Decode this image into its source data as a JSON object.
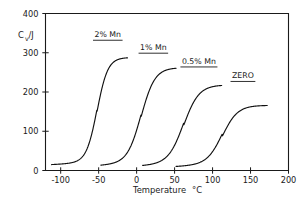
{
  "chart_data": {
    "type": "line",
    "title": "",
    "xlabel": "Temperature  °C",
    "ylabel": "Cv/J",
    "ylabel_main": "C",
    "ylabel_sub": "v",
    "ylabel_tail": "/J",
    "xlim": [
      -120,
      200
    ],
    "ylim": [
      0,
      400
    ],
    "xticks": [
      -100,
      -50,
      0,
      50,
      100,
      150,
      200
    ],
    "xtick_labels": [
      "-100",
      "-50",
      "0",
      "50",
      "100",
      "150",
      "200"
    ],
    "yticks": [
      0,
      100,
      200,
      300,
      400
    ],
    "ytick_labels": [
      "0",
      "100",
      "200",
      "300",
      "400"
    ],
    "grid": false,
    "legend_position": "inline-annotations",
    "series": [
      {
        "name": "2% Mn",
        "label": "2% Mn",
        "baseline": 15,
        "plateau": 288,
        "midpoint": -52,
        "width": 7,
        "x_start": -112,
        "x_end": -12,
        "label_x": -38,
        "label_y": 340
      },
      {
        "name": "1% Mn",
        "label": "1% Mn",
        "baseline": 13,
        "plateau": 262,
        "midpoint": 6,
        "width": 9,
        "x_start": -47,
        "x_end": 52,
        "label_x": 22,
        "label_y": 307
      },
      {
        "name": "0.5% Mn",
        "label": "0.5% Mn",
        "baseline": 12,
        "plateau": 218,
        "midpoint": 62,
        "width": 10,
        "x_start": 8,
        "x_end": 112,
        "label_x": 82,
        "label_y": 272
      },
      {
        "name": "ZERO",
        "label": "ZERO",
        "baseline": 10,
        "plateau": 166,
        "midpoint": 113,
        "width": 10,
        "x_start": 52,
        "x_end": 172,
        "label_x": 140,
        "label_y": 235
      }
    ]
  },
  "axes": {
    "y_label_text": "/J",
    "y_label_c": "C",
    "y_label_v": "v",
    "x_label_text": "Temperature",
    "x_label_unit": "°C"
  },
  "colors": {
    "ink": "#1a1a1a",
    "curve": "#111111",
    "background": "#ffffff"
  }
}
